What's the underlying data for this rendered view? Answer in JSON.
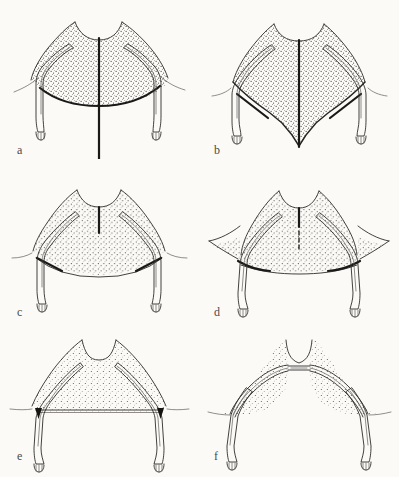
{
  "figure": {
    "kind": "scientific-line-drawing",
    "background_color": "#fbfaf7",
    "ink_color": "#2e2c2a",
    "heavy_ink_color": "#151413",
    "stipple_color": "#3a3836",
    "panel_count": 6,
    "panels": [
      {
        "id": "a",
        "label": "a",
        "description": "Broad fan-shaped plate with a long heavy median bar extending well below the ventral margin; ventral margin gently convex with heavy thickened edge; paired slender limbs descend at the lateral corners.",
        "median_bar": "long, extends far beyond ventral margin",
        "ventral_margin": "gently convex, heavily inked",
        "stipple_density": "dense"
      },
      {
        "id": "b",
        "label": "b",
        "description": "Plate drawn out into a deep V; median bar runs the full depth to the ventral apex; heavy oblique bars at the upper lateral corners; limbs splayed outward.",
        "median_bar": "full depth to ventral apex",
        "ventral_margin": "acutely pointed (V-shaped)",
        "stipple_density": "dense"
      },
      {
        "id": "c",
        "label": "c",
        "description": "Broad low plate with only a short median bar near the dorsal notch; ventral margin polygonal and flattened; heavy ink along the lateral ventral edges.",
        "median_bar": "short, dorsal only",
        "ventral_margin": "flattened polygonal",
        "stipple_density": "medium"
      },
      {
        "id": "d",
        "label": "d",
        "description": "Plate narrowed laterally with wing-like stippled flanges; short dashed median bar; ventral margin nearly straight with heavy crescentic marks at each lateral corner.",
        "median_bar": "short, dashed",
        "ventral_margin": "nearly straight with crescentic lateral marks",
        "stipple_density": "medium"
      },
      {
        "id": "e",
        "label": "e",
        "description": "Strongly reduced plate forming a broad low arch; no median bar; straight ventral bar spanning between the limb bases; small solid black triangular markers at each limb junction.",
        "median_bar": "absent",
        "ventral_margin": "straight transverse bar",
        "stipple_density": "light"
      },
      {
        "id": "f",
        "label": "f",
        "description": "Maximally reduced: the plate is lost, leaving only slender paired rods meeting at a narrow median bridge; limbs very long and widely splayed; stippling restricted to two lateral triangles.",
        "median_bar": "absent, replaced by narrow median bridge",
        "ventral_margin": "absent",
        "stipple_density": "light"
      }
    ]
  }
}
